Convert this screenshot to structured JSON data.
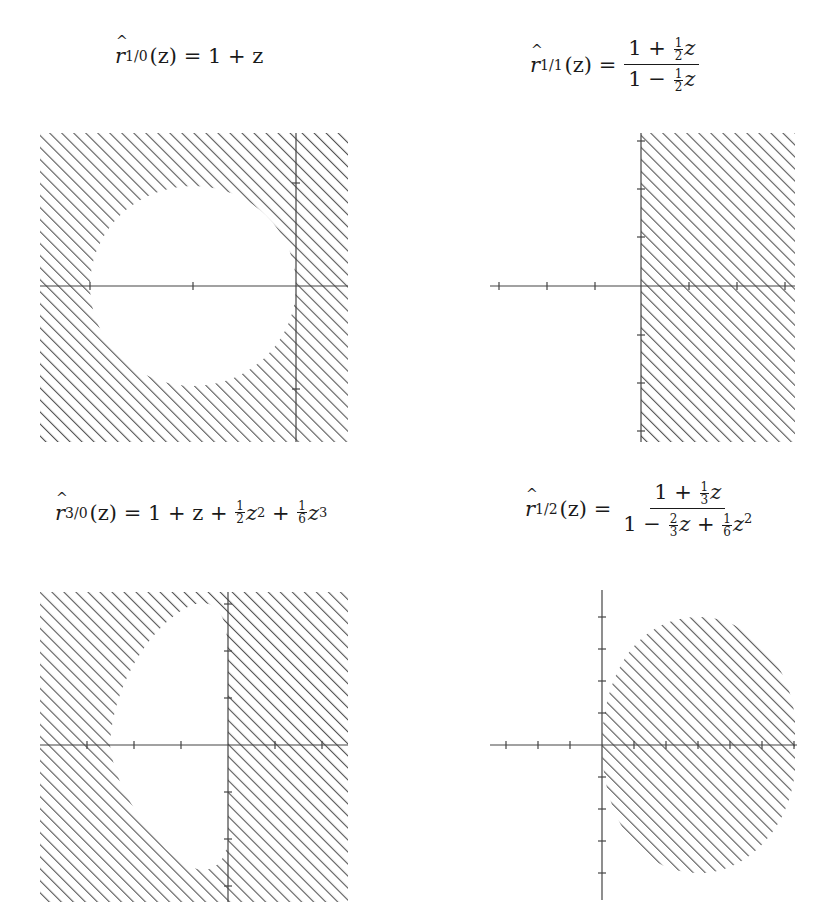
{
  "figure": {
    "hatch_color": "#555555",
    "axis_color": "#444444"
  },
  "panels": [
    {
      "id": "r10",
      "title": {
        "lhs": "r",
        "index": "1/0",
        "arg": "(z)",
        "rhs": "= 1 + z"
      },
      "formula": "r_{1/0}(z) = 1 + z",
      "hatched_region": "exterior of disk |1+z|<1",
      "ticks_x": [
        -2,
        -1,
        0
      ],
      "ticks_y": [
        -1,
        1
      ]
    },
    {
      "id": "r11",
      "title": {
        "lhs": "r",
        "index": "1/1",
        "arg": "(z)",
        "numerator": "1 + ½z",
        "denominator": "1 − ½z"
      },
      "formula": "r_{1/1}(z) = (1 + 1/2 z)/(1 - 1/2 z)",
      "hatched_region": "right half-plane Re z >= 0",
      "ticks_x": [
        -3,
        -2,
        -1,
        0,
        1,
        2,
        3
      ],
      "ticks_y": [
        -3,
        -2,
        -1,
        1,
        2,
        3
      ]
    },
    {
      "id": "r30",
      "title": {
        "lhs": "r",
        "index": "3/0",
        "arg": "(z)",
        "rhs": "= 1 + z + ½z² + ⅙z³"
      },
      "formula": "r_{3/0}(z) = 1 + z + 1/2 z^2 + 1/6 z^3",
      "hatched_region": "exterior of RK3 stability region",
      "ticks_x": [
        -3,
        -2,
        -1,
        0,
        1,
        2
      ],
      "ticks_y": [
        -3,
        -2,
        -1,
        1,
        2,
        3
      ]
    },
    {
      "id": "r12",
      "title": {
        "lhs": "r",
        "index": "1/2",
        "arg": "(z)",
        "numerator": "1 + ⅓z",
        "denominator": "1 − ⅔z + ⅙z²"
      },
      "formula": "r_{1/2}(z) = (1 + 1/3 z)/(1 - 2/3 z + 1/6 z^2)",
      "hatched_region": "bounded region in right half-plane",
      "ticks_x": [
        -3,
        -2,
        -1,
        0,
        1,
        2,
        3,
        4,
        5,
        6
      ],
      "ticks_y": [
        -4,
        -3,
        -2,
        -1,
        1,
        2,
        3,
        4
      ]
    }
  ],
  "text": {
    "p1_hat": "r",
    "p1_sub": "1/0",
    "p1_arg": "(z) = 1 + z",
    "p2_hat": "r",
    "p2_sub": "1/1",
    "p2_arg": "(z) =",
    "p2_num_a": "1 + ",
    "p2_num_f_n": "1",
    "p2_num_f_d": "2",
    "p2_num_b": "z",
    "p2_den_a": "1 − ",
    "p2_den_f_n": "1",
    "p2_den_f_d": "2",
    "p2_den_b": "z",
    "p3_hat": "r",
    "p3_sub": "3/0",
    "p3_arg": "(z) = 1 + z + ",
    "p3_f1_n": "1",
    "p3_f1_d": "2",
    "p3_z2": "z",
    "p3_e2": "2",
    "p3_plus": " + ",
    "p3_f2_n": "1",
    "p3_f2_d": "6",
    "p3_z3": "z",
    "p3_e3": "3",
    "p4_hat": "r",
    "p4_sub": "1/2",
    "p4_arg": "(z) =",
    "p4_num_a": "1 + ",
    "p4_num_f_n": "1",
    "p4_num_f_d": "3",
    "p4_num_b": "z",
    "p4_den_a": "1 − ",
    "p4_den_f1_n": "2",
    "p4_den_f1_d": "3",
    "p4_den_b": "z + ",
    "p4_den_f2_n": "1",
    "p4_den_f2_d": "6",
    "p4_den_c": "z",
    "p4_den_e": "2"
  }
}
